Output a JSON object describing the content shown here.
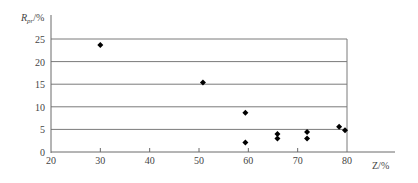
{
  "chart_data": {
    "type": "scatter",
    "title": "",
    "xlabel": "Z/%",
    "ylabel": "Rpr/%",
    "ylabel_main": "R",
    "ylabel_sub": "pr",
    "ylabel_unit": "/%",
    "xlim": [
      20,
      80
    ],
    "ylim": [
      0,
      25
    ],
    "x_ticks": [
      20,
      30,
      40,
      50,
      60,
      70,
      80
    ],
    "y_ticks": [
      0,
      5,
      10,
      15,
      20,
      25
    ],
    "grid": "horizontal",
    "marker": "diamond",
    "marker_color": "#000000",
    "points": [
      {
        "x": 30,
        "y": 23.7
      },
      {
        "x": 50.8,
        "y": 15.4
      },
      {
        "x": 59.4,
        "y": 8.7
      },
      {
        "x": 59.4,
        "y": 2.1
      },
      {
        "x": 65.9,
        "y": 4.0
      },
      {
        "x": 65.9,
        "y": 3.0
      },
      {
        "x": 71.9,
        "y": 4.4
      },
      {
        "x": 71.9,
        "y": 3.0
      },
      {
        "x": 78.4,
        "y": 5.6
      },
      {
        "x": 79.6,
        "y": 4.8
      }
    ]
  }
}
